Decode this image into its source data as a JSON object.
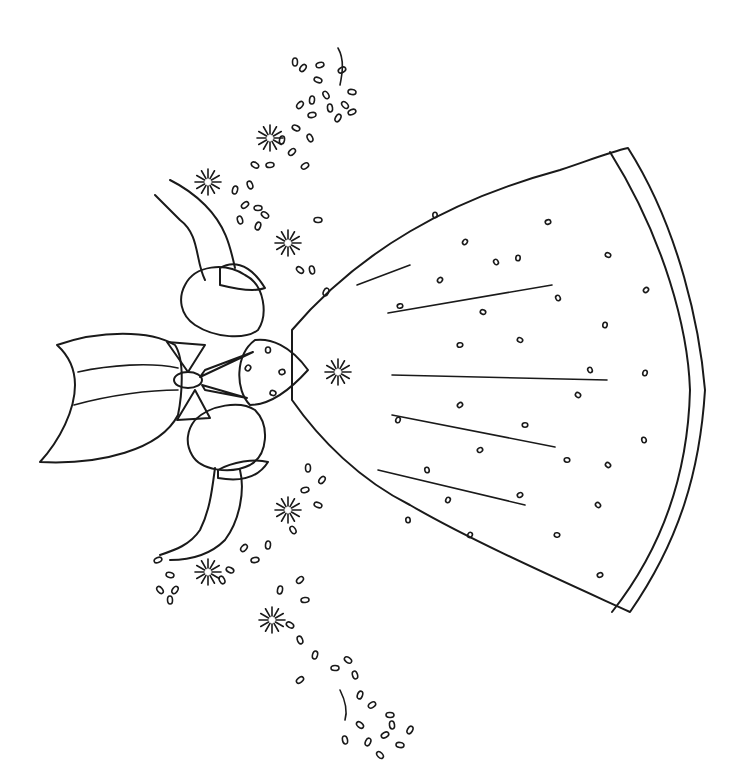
{
  "image": {
    "type": "embroidery-pattern-line-art",
    "subject": "bonnet girl in full skirt with flower garlands, rotated 90 degrees",
    "background_color": "#ffffff",
    "line_color": "#1a1a1a"
  },
  "skirt": {
    "dots": [
      [
        435,
        215
      ],
      [
        465,
        242
      ],
      [
        548,
        222
      ],
      [
        608,
        255
      ],
      [
        496,
        262
      ],
      [
        518,
        258
      ],
      [
        440,
        280
      ],
      [
        400,
        306
      ],
      [
        483,
        312
      ],
      [
        558,
        298
      ],
      [
        605,
        325
      ],
      [
        646,
        290
      ],
      [
        460,
        345
      ],
      [
        520,
        340
      ],
      [
        590,
        370
      ],
      [
        645,
        373
      ],
      [
        460,
        405
      ],
      [
        525,
        425
      ],
      [
        578,
        395
      ],
      [
        644,
        440
      ],
      [
        398,
        420
      ],
      [
        480,
        450
      ],
      [
        567,
        460
      ],
      [
        608,
        465
      ],
      [
        427,
        470
      ],
      [
        448,
        500
      ],
      [
        520,
        495
      ],
      [
        557,
        535
      ],
      [
        598,
        505
      ],
      [
        408,
        520
      ],
      [
        470,
        535
      ],
      [
        600,
        575
      ]
    ]
  },
  "bodice": {
    "dots": [
      [
        268,
        350
      ],
      [
        248,
        368
      ],
      [
        282,
        372
      ],
      [
        273,
        393
      ]
    ]
  },
  "garlands": {
    "top_dots": [
      [
        295,
        62
      ],
      [
        303,
        68
      ],
      [
        320,
        65
      ],
      [
        318,
        80
      ],
      [
        326,
        95
      ],
      [
        312,
        100
      ],
      [
        300,
        105
      ],
      [
        312,
        115
      ],
      [
        296,
        128
      ],
      [
        310,
        138
      ],
      [
        282,
        140
      ],
      [
        292,
        152
      ],
      [
        270,
        165
      ],
      [
        255,
        165
      ],
      [
        250,
        185
      ],
      [
        235,
        190
      ],
      [
        245,
        205
      ],
      [
        258,
        208
      ],
      [
        265,
        215
      ],
      [
        240,
        220
      ],
      [
        258,
        226
      ],
      [
        305,
        166
      ],
      [
        318,
        220
      ],
      [
        300,
        270
      ],
      [
        312,
        270
      ],
      [
        326,
        292
      ],
      [
        342,
        70
      ],
      [
        352,
        92
      ],
      [
        345,
        105
      ],
      [
        330,
        108
      ],
      [
        338,
        118
      ],
      [
        352,
        112
      ]
    ],
    "bottom_dots": [
      [
        308,
        468
      ],
      [
        322,
        480
      ],
      [
        305,
        490
      ],
      [
        318,
        505
      ],
      [
        293,
        530
      ],
      [
        268,
        545
      ],
      [
        244,
        548
      ],
      [
        255,
        560
      ],
      [
        230,
        570
      ],
      [
        222,
        580
      ],
      [
        280,
        590
      ],
      [
        300,
        580
      ],
      [
        305,
        600
      ],
      [
        290,
        625
      ],
      [
        300,
        640
      ],
      [
        315,
        655
      ],
      [
        300,
        680
      ],
      [
        335,
        668
      ],
      [
        348,
        660
      ],
      [
        355,
        675
      ],
      [
        360,
        695
      ],
      [
        372,
        705
      ],
      [
        390,
        715
      ],
      [
        360,
        725
      ],
      [
        345,
        740
      ],
      [
        368,
        742
      ],
      [
        385,
        735
      ],
      [
        400,
        745
      ],
      [
        380,
        755
      ],
      [
        392,
        725
      ],
      [
        410,
        730
      ],
      [
        158,
        560
      ],
      [
        170,
        575
      ],
      [
        160,
        590
      ],
      [
        170,
        600
      ],
      [
        175,
        590
      ]
    ],
    "sunbursts": [
      [
        270,
        138
      ],
      [
        288,
        243
      ],
      [
        208,
        182
      ],
      [
        338,
        372
      ],
      [
        288,
        510
      ],
      [
        208,
        572
      ],
      [
        272,
        620
      ]
    ]
  }
}
